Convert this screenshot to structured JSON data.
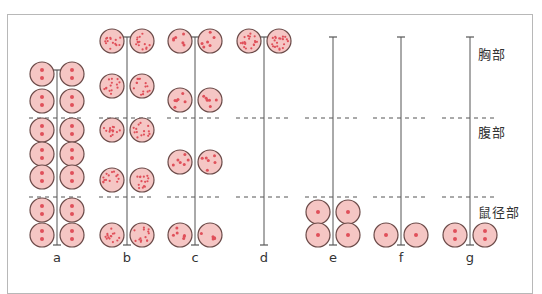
{
  "regions": {
    "thoracic": "胸部",
    "abdominal": "腹部",
    "inguinal": "鼠径部"
  },
  "colors": {
    "gland_fill": "#f5c6c4",
    "gland_stroke": "#6b4a48",
    "dot": "#e0505a",
    "axis": "#555555",
    "dashed": "#555555",
    "frame": "#b8b8b8"
  },
  "columns": [
    {
      "label": "a",
      "dots": 2,
      "axis_top": 70,
      "rows": [
        74,
        101,
        130,
        154,
        177,
        210,
        235
      ]
    },
    {
      "label": "b",
      "dots": 14,
      "axis_top": 37,
      "rows": [
        41,
        86,
        130,
        180,
        235
      ]
    },
    {
      "label": "c",
      "dots": 6,
      "axis_top": 37,
      "rows": [
        41,
        100,
        162,
        235
      ]
    },
    {
      "label": "d",
      "dots": 20,
      "axis_top": 37,
      "rows": [
        41
      ]
    },
    {
      "label": "e",
      "dots": 1,
      "axis_top": 37,
      "rows": [
        212,
        235
      ]
    },
    {
      "label": "f",
      "dots": 1,
      "axis_top": 37,
      "rows": [
        235
      ]
    },
    {
      "label": "g",
      "dots": 2,
      "axis_top": 37,
      "rows": [
        235
      ]
    }
  ],
  "dashed_lines_y": [
    118,
    197
  ]
}
